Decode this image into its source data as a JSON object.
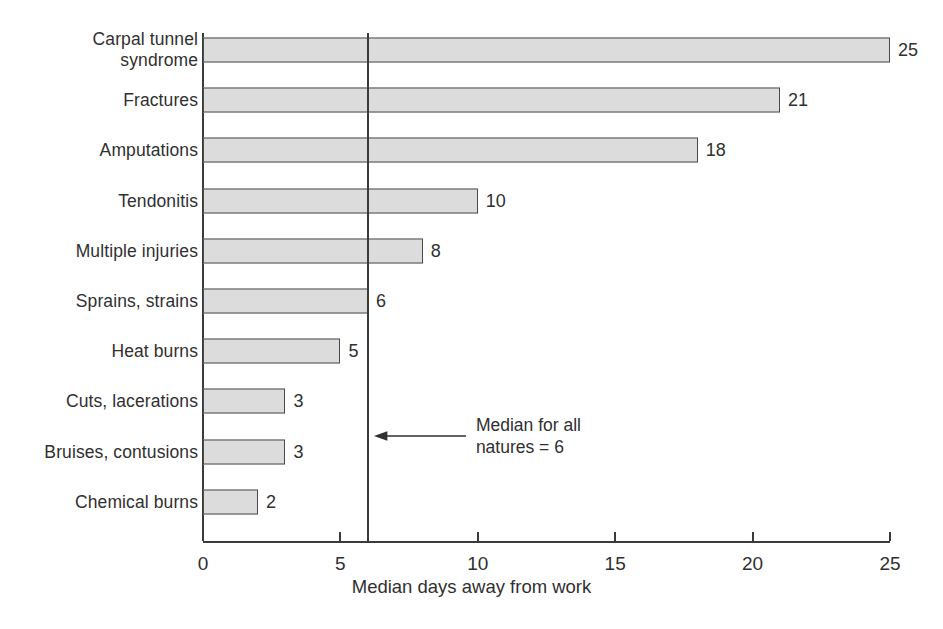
{
  "chart_data": {
    "type": "bar",
    "orientation": "horizontal",
    "title": "",
    "subtitle": "",
    "xlabel": "Median days away from work",
    "ylabel": "",
    "categories": [
      "Carpal tunnel\nsyndrome",
      "Fractures",
      "Amputations",
      "Tendonitis",
      "Multiple injuries",
      "Sprains, strains",
      "Heat burns",
      "Cuts, lacerations",
      "Bruises, contusions",
      "Chemical burns"
    ],
    "values": [
      25,
      21,
      18,
      10,
      8,
      6,
      5,
      3,
      3,
      2
    ],
    "value_labels": [
      "25",
      "21",
      "18",
      "10",
      "8",
      "6",
      "5",
      "3",
      "3",
      "2"
    ],
    "xlim": [
      0,
      25
    ],
    "xticks": [
      0,
      5,
      10,
      15,
      20,
      25
    ],
    "xtick_labels": [
      "0",
      "5",
      "10",
      "15",
      "20",
      "25"
    ],
    "grid": false,
    "legend": null,
    "bar_fill_color": "#dcdcdc",
    "bar_edge_color": "#4a4a4a",
    "axis_color": "#3a3a3a",
    "background_color": "#ffffff",
    "annotations": [
      {
        "name": "median-reference",
        "text": "Median for all\nnatures = 6",
        "value": 6,
        "arrow": "left"
      }
    ]
  }
}
